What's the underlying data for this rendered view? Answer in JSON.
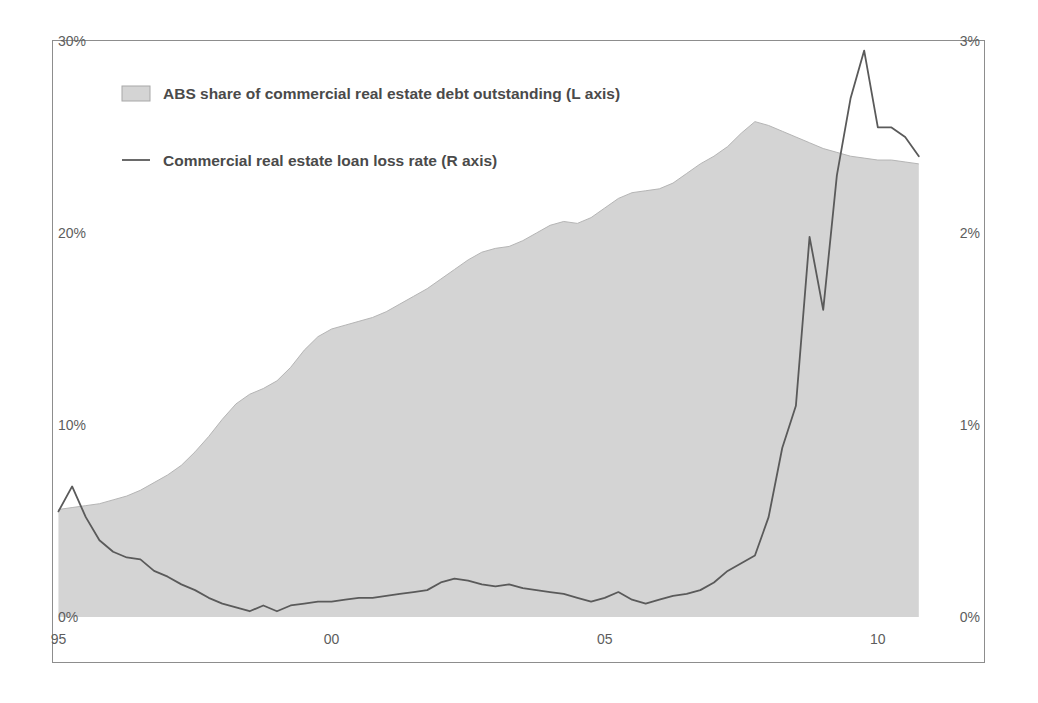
{
  "chart_data": {
    "type": "area",
    "title": "",
    "subtitle": "",
    "xlabel": "",
    "ylabel": "",
    "grid": false,
    "legend_position": "top-left",
    "background": "#ffffff",
    "frame_color": "#8d8d8d",
    "axes": {
      "x": {
        "min": 1994.9,
        "max": 2010.9,
        "ticks": [
          1995,
          2000,
          2005,
          2010
        ],
        "tick_labels": [
          "95",
          "00",
          "05",
          "10"
        ]
      },
      "y_left": {
        "min": 0,
        "max": 30,
        "ticks": [
          0,
          10,
          20,
          30
        ],
        "tick_labels": [
          "0%",
          "10%",
          "20%",
          "30%"
        ],
        "unit": "%"
      },
      "y_right": {
        "min": 0,
        "max": 3,
        "ticks": [
          0,
          1,
          2,
          3
        ],
        "tick_labels": [
          "0%",
          "1%",
          "2%",
          "3%"
        ],
        "unit": "%"
      }
    },
    "legend": [
      {
        "label": "ABS share of commercial real estate debt outstanding (L axis)",
        "marker": "swatch",
        "color": "#d4d4d4",
        "border_color": "#a8a8a8"
      },
      {
        "label": "Commercial real estate loan loss rate (R axis)",
        "marker": "line",
        "color": "#5a5a5a"
      }
    ],
    "series": [
      {
        "name": "ABS share of commercial real estate debt outstanding (L axis)",
        "type": "area",
        "axis": "left",
        "fill": "#d4d4d4",
        "stroke": "#b5b5b5",
        "x": [
          1995.0,
          1995.25,
          1995.5,
          1995.75,
          1996.0,
          1996.25,
          1996.5,
          1996.75,
          1997.0,
          1997.25,
          1997.5,
          1997.75,
          1998.0,
          1998.25,
          1998.5,
          1998.75,
          1999.0,
          1999.25,
          1999.5,
          1999.75,
          2000.0,
          2000.25,
          2000.5,
          2000.75,
          2001.0,
          2001.25,
          2001.5,
          2001.75,
          2002.0,
          2002.25,
          2002.5,
          2002.75,
          2003.0,
          2003.25,
          2003.5,
          2003.75,
          2004.0,
          2004.25,
          2004.5,
          2004.75,
          2005.0,
          2005.25,
          2005.5,
          2005.75,
          2006.0,
          2006.25,
          2006.5,
          2006.75,
          2007.0,
          2007.25,
          2007.5,
          2007.75,
          2008.0,
          2008.25,
          2008.5,
          2008.75,
          2009.0,
          2009.25,
          2009.5,
          2009.75,
          2010.0,
          2010.25,
          2010.5,
          2010.75
        ],
        "values": [
          5.6,
          5.7,
          5.8,
          5.9,
          6.1,
          6.3,
          6.6,
          7.0,
          7.4,
          7.9,
          8.6,
          9.4,
          10.3,
          11.1,
          11.6,
          11.9,
          12.3,
          13.0,
          13.9,
          14.6,
          15.0,
          15.2,
          15.4,
          15.6,
          15.9,
          16.3,
          16.7,
          17.1,
          17.6,
          18.1,
          18.6,
          19.0,
          19.2,
          19.3,
          19.6,
          20.0,
          20.4,
          20.6,
          20.5,
          20.8,
          21.3,
          21.8,
          22.1,
          22.2,
          22.3,
          22.6,
          23.1,
          23.6,
          24.0,
          24.5,
          25.2,
          25.8,
          25.6,
          25.3,
          25.0,
          24.7,
          24.4,
          24.2,
          24.0,
          23.9,
          23.8,
          23.8,
          23.7,
          23.6
        ]
      },
      {
        "name": "Commercial real estate loan loss rate (R axis)",
        "type": "line",
        "axis": "right",
        "stroke": "#5a5a5a",
        "stroke_width": 1.8,
        "x": [
          1995.0,
          1995.25,
          1995.5,
          1995.75,
          1996.0,
          1996.25,
          1996.5,
          1996.75,
          1997.0,
          1997.25,
          1997.5,
          1997.75,
          1998.0,
          1998.25,
          1998.5,
          1998.75,
          1999.0,
          1999.25,
          1999.5,
          1999.75,
          2000.0,
          2000.25,
          2000.5,
          2000.75,
          2001.0,
          2001.25,
          2001.5,
          2001.75,
          2002.0,
          2002.25,
          2002.5,
          2002.75,
          2003.0,
          2003.25,
          2003.5,
          2003.75,
          2004.0,
          2004.25,
          2004.5,
          2004.75,
          2005.0,
          2005.25,
          2005.5,
          2005.75,
          2006.0,
          2006.25,
          2006.5,
          2006.75,
          2007.0,
          2007.25,
          2007.5,
          2007.75,
          2008.0,
          2008.25,
          2008.5,
          2008.75,
          2009.0,
          2009.25,
          2009.5,
          2009.75,
          2010.0,
          2010.25,
          2010.5,
          2010.75
        ],
        "values": [
          0.55,
          0.68,
          0.52,
          0.4,
          0.34,
          0.31,
          0.3,
          0.24,
          0.21,
          0.17,
          0.14,
          0.1,
          0.07,
          0.05,
          0.03,
          0.06,
          0.03,
          0.06,
          0.07,
          0.08,
          0.08,
          0.09,
          0.1,
          0.1,
          0.11,
          0.12,
          0.13,
          0.14,
          0.18,
          0.2,
          0.19,
          0.17,
          0.16,
          0.17,
          0.15,
          0.14,
          0.13,
          0.12,
          0.1,
          0.08,
          0.1,
          0.13,
          0.09,
          0.07,
          0.09,
          0.11,
          0.12,
          0.14,
          0.18,
          0.24,
          0.28,
          0.32,
          0.52,
          0.88,
          1.1,
          1.98,
          1.6,
          2.3,
          2.7,
          2.95,
          2.55,
          2.55,
          2.5,
          2.4
        ]
      }
    ]
  }
}
